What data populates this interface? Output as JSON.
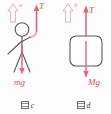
{
  "figure": {
    "title_not_shown": "",
    "colors": {
      "force_arrow": "#e8636f",
      "accel_arrow_outline": "#eeb4ba",
      "figure_stroke": "#5a5a5a",
      "label_force": "#d4505c",
      "label_accel": "#e09aa2",
      "background": "#fdfdfd"
    }
  },
  "panels": [
    {
      "id": "c",
      "caption_symbol": "图",
      "caption_letter": "c",
      "subject": "stick-figure-person-hanging-on-rope",
      "accel_arrow": {
        "label": "a",
        "direction": "up",
        "style": "hollow-outline"
      },
      "forces": [
        {
          "label": "T",
          "direction": "up",
          "name": "tension"
        },
        {
          "label": "mg",
          "direction": "down",
          "name": "weight"
        }
      ]
    },
    {
      "id": "d",
      "caption_symbol": "图",
      "caption_letter": "d",
      "subject": "rounded-block-hanging-on-rope",
      "accel_arrow": {
        "label": "b",
        "direction": "up",
        "style": "hollow-outline"
      },
      "forces": [
        {
          "label": "T",
          "direction": "up",
          "name": "tension"
        },
        {
          "label": "Mg",
          "direction": "down",
          "name": "weight"
        }
      ]
    }
  ]
}
